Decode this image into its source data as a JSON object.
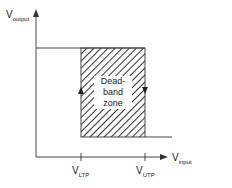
{
  "diagram": {
    "y_axis": {
      "main": "V",
      "sub": "output"
    },
    "x_axis": {
      "main": "V",
      "sub": "input"
    },
    "ticks": [
      {
        "main": "V",
        "sub": "LTP"
      },
      {
        "main": "V",
        "sub": "UTP"
      }
    ],
    "zone_label": [
      "Dead-",
      "band",
      "zone"
    ],
    "colors": {
      "line": "#444444",
      "hatch": "#333333",
      "background": "#ffffff"
    }
  }
}
